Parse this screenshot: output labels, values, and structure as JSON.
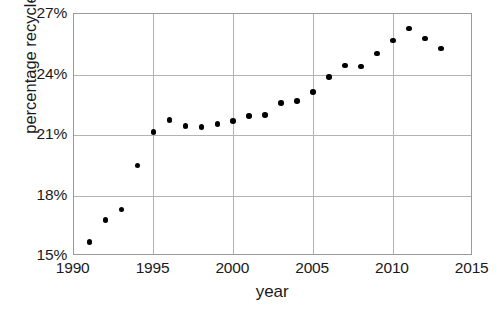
{
  "chart_data": {
    "type": "scatter",
    "title": "",
    "xlabel": "year",
    "ylabel": "percentage recycled",
    "xlim": [
      1990,
      2015
    ],
    "ylim": [
      15,
      27
    ],
    "xticks": [
      "1990",
      "1995",
      "2000",
      "2005",
      "2010",
      "2015"
    ],
    "xtick_values": [
      1990,
      1995,
      2000,
      2005,
      2010,
      2015
    ],
    "yticks": [
      "15%",
      "18%",
      "21%",
      "24%",
      "27%"
    ],
    "ytick_values": [
      15,
      18,
      21,
      24,
      27
    ],
    "grid": true,
    "legend": null,
    "marker": "filled-circle",
    "marker_color": "#000000",
    "grid_color": "#b3b3b3",
    "x": [
      1991,
      1992,
      1993,
      1994,
      1995,
      1996,
      1997,
      1998,
      1999,
      2000,
      2001,
      2002,
      2003,
      2004,
      2005,
      2006,
      2007,
      2008,
      2009,
      2010,
      2011,
      2012,
      2013
    ],
    "values": [
      15.7,
      16.8,
      17.3,
      19.5,
      21.15,
      21.75,
      21.45,
      21.4,
      21.55,
      21.7,
      21.95,
      22.0,
      22.6,
      22.7,
      23.15,
      23.9,
      24.45,
      24.4,
      25.05,
      25.7,
      26.3,
      25.8,
      25.3
    ],
    "points": [
      {
        "year": 1991,
        "percent": 15.7
      },
      {
        "year": 1992,
        "percent": 16.8
      },
      {
        "year": 1993,
        "percent": 17.3
      },
      {
        "year": 1994,
        "percent": 19.5
      },
      {
        "year": 1995,
        "percent": 21.15
      },
      {
        "year": 1996,
        "percent": 21.75
      },
      {
        "year": 1997,
        "percent": 21.45
      },
      {
        "year": 1998,
        "percent": 21.4
      },
      {
        "year": 1999,
        "percent": 21.55
      },
      {
        "year": 2000,
        "percent": 21.7
      },
      {
        "year": 2001,
        "percent": 21.95
      },
      {
        "year": 2002,
        "percent": 22.0
      },
      {
        "year": 2003,
        "percent": 22.6
      },
      {
        "year": 2004,
        "percent": 22.7
      },
      {
        "year": 2005,
        "percent": 23.15
      },
      {
        "year": 2006,
        "percent": 23.9
      },
      {
        "year": 2007,
        "percent": 24.45
      },
      {
        "year": 2008,
        "percent": 24.4
      },
      {
        "year": 2009,
        "percent": 25.05
      },
      {
        "year": 2010,
        "percent": 25.7
      },
      {
        "year": 2011,
        "percent": 26.3
      },
      {
        "year": 2012,
        "percent": 25.8
      },
      {
        "year": 2013,
        "percent": 25.3
      }
    ]
  }
}
